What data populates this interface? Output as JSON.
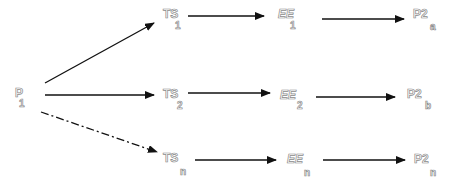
{
  "diagram": {
    "type": "flow",
    "nodes": [
      {
        "id": "P1",
        "main": "P",
        "sub": "1"
      },
      {
        "id": "TS1",
        "main": "TS",
        "sub": "1"
      },
      {
        "id": "TS2",
        "main": "TS",
        "sub": "2"
      },
      {
        "id": "TSn",
        "main": "TS",
        "sub": "n"
      },
      {
        "id": "EE1",
        "main": "EE",
        "sub": "1"
      },
      {
        "id": "EE2",
        "main": "EE",
        "sub": "2"
      },
      {
        "id": "EEn",
        "main": "EE",
        "sub": "n"
      },
      {
        "id": "P2a",
        "main": "P2",
        "sub": "a"
      },
      {
        "id": "P2b",
        "main": "P2",
        "sub": "b"
      },
      {
        "id": "P2n",
        "main": "P2",
        "sub": "n"
      }
    ],
    "edges": [
      {
        "from": "P1",
        "to": "TS1",
        "style": "solid"
      },
      {
        "from": "P1",
        "to": "TS2",
        "style": "solid"
      },
      {
        "from": "P1",
        "to": "TSn",
        "style": "dash-dot"
      },
      {
        "from": "TS1",
        "to": "EE1",
        "style": "solid"
      },
      {
        "from": "TS2",
        "to": "EE2",
        "style": "solid"
      },
      {
        "from": "TSn",
        "to": "EEn",
        "style": "solid"
      },
      {
        "from": "EE1",
        "to": "P2a",
        "style": "solid"
      },
      {
        "from": "EE2",
        "to": "P2b",
        "style": "solid"
      },
      {
        "from": "EEn",
        "to": "P2n",
        "style": "solid"
      }
    ],
    "colors": {
      "arrow": "#111111",
      "label_outline": "#8a8a8a",
      "background": "#ffffff"
    }
  }
}
